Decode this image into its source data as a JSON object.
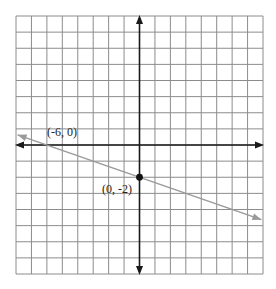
{
  "chart_data": {
    "type": "line",
    "title": "",
    "xlabel": "",
    "ylabel": "",
    "xlim": [
      -8,
      8
    ],
    "ylim": [
      -8,
      8
    ],
    "grid": true,
    "grid_step": 1,
    "series": [
      {
        "name": "line",
        "equation": "y = -x/3 - 2",
        "slope": -0.3333,
        "intercept": -2,
        "x": [
          -7.9,
          7.9
        ],
        "y": [
          0.63,
          -4.63
        ],
        "color": "#9a9a9a",
        "arrows": "both"
      }
    ],
    "points": [
      {
        "x": -6,
        "y": 0,
        "label": "(-6, 0)",
        "marker": false
      },
      {
        "x": 0,
        "y": -2,
        "label": "(0, -2)",
        "marker": true
      }
    ],
    "colors": {
      "grid": "#8c8c8c",
      "axes": "#1a1a1a",
      "line": "#9a9a9a",
      "point": "#111111"
    }
  },
  "labels": {
    "point_a": "(-6, 0)",
    "point_b": "(0, -2)"
  }
}
